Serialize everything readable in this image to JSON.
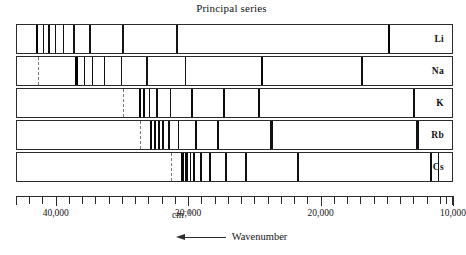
{
  "title": "Principal series",
  "axis": {
    "label": "Wavenumber",
    "unit_text": "cm",
    "unit_exponent": "−1",
    "unit_pos": 30500,
    "min": 10000,
    "max": 43000,
    "direction": "decreasing-right",
    "tick_labels": [
      {
        "value": 40000,
        "text": "40,000"
      },
      {
        "value": 30000,
        "text": "30,000"
      },
      {
        "value": 20000,
        "text": "20,000"
      },
      {
        "value": 10000,
        "text": "10,000"
      }
    ],
    "minor_tick_step": 1000,
    "minor_ticks": [
      43000,
      42000,
      41000,
      40000,
      39000,
      38000,
      37000,
      36000,
      35000,
      34000,
      33000,
      32000,
      31000,
      30000,
      29000,
      28000,
      27000,
      26000,
      25000,
      24000,
      23000,
      22000,
      21000,
      20000,
      19000,
      18000,
      17000,
      16000,
      15000,
      14000,
      13000,
      12000,
      11000,
      10500,
      10000
    ]
  },
  "chart_data": {
    "type": "spectrum",
    "title": "Principal series",
    "xlabel": "Wavenumber",
    "xunit": "cm^-1",
    "xlim": [
      43000,
      10000
    ],
    "x_axis_reversed": true,
    "ylabel": "",
    "grid": false,
    "legend": "row-labels-right",
    "series": [
      {
        "name": "Li",
        "label": "Li",
        "series_limit": 43487,
        "lines": [
          {
            "wavenumber": 43487,
            "intensity": 0.35,
            "style": "dashed"
          },
          {
            "wavenumber": 41500,
            "intensity": 1.0,
            "style": "solid"
          },
          {
            "wavenumber": 41000,
            "intensity": 0.6,
            "style": "solid"
          },
          {
            "wavenumber": 40600,
            "intensity": 0.6,
            "style": "solid"
          },
          {
            "wavenumber": 40100,
            "intensity": 0.6,
            "style": "solid"
          },
          {
            "wavenumber": 39500,
            "intensity": 0.55,
            "style": "solid"
          },
          {
            "wavenumber": 38700,
            "intensity": 0.5,
            "style": "solid"
          },
          {
            "wavenumber": 37500,
            "intensity": 0.5,
            "style": "solid"
          },
          {
            "wavenumber": 35000,
            "intensity": 0.5,
            "style": "solid"
          },
          {
            "wavenumber": 30900,
            "intensity": 0.5,
            "style": "solid"
          },
          {
            "wavenumber": 14904,
            "intensity": 1.0,
            "style": "solid"
          }
        ]
      },
      {
        "name": "Na",
        "label": "Na",
        "series_limit": 41449,
        "lines": [
          {
            "wavenumber": 41449,
            "intensity": 0.35,
            "style": "dashed"
          },
          {
            "wavenumber": 38500,
            "intensity": 1.0,
            "style": "solid"
          },
          {
            "wavenumber": 37900,
            "intensity": 0.6,
            "style": "solid"
          },
          {
            "wavenumber": 37300,
            "intensity": 0.6,
            "style": "solid"
          },
          {
            "wavenumber": 36400,
            "intensity": 0.55,
            "style": "solid"
          },
          {
            "wavenumber": 35100,
            "intensity": 0.5,
            "style": "solid"
          },
          {
            "wavenumber": 33200,
            "intensity": 0.5,
            "style": "solid"
          },
          {
            "wavenumber": 30270,
            "intensity": 0.5,
            "style": "solid"
          },
          {
            "wavenumber": 24500,
            "intensity": 0.8,
            "style": "solid"
          },
          {
            "wavenumber": 16968,
            "intensity": 0.6,
            "style": "solid"
          },
          {
            "wavenumber": 16956,
            "intensity": 0.6,
            "style": "solid"
          }
        ]
      },
      {
        "name": "K",
        "label": "K",
        "series_limit": 35009,
        "lines": [
          {
            "wavenumber": 35009,
            "intensity": 0.35,
            "style": "dashed"
          },
          {
            "wavenumber": 33700,
            "intensity": 0.9,
            "style": "solid"
          },
          {
            "wavenumber": 33400,
            "intensity": 0.9,
            "style": "solid"
          },
          {
            "wavenumber": 33000,
            "intensity": 0.6,
            "style": "solid"
          },
          {
            "wavenumber": 32400,
            "intensity": 0.6,
            "style": "solid"
          },
          {
            "wavenumber": 31400,
            "intensity": 0.55,
            "style": "solid"
          },
          {
            "wavenumber": 29800,
            "intensity": 0.7,
            "style": "solid"
          },
          {
            "wavenumber": 27400,
            "intensity": 0.7,
            "style": "solid"
          },
          {
            "wavenumber": 24700,
            "intensity": 0.7,
            "style": "solid"
          },
          {
            "wavenumber": 13042,
            "intensity": 0.6,
            "style": "solid"
          },
          {
            "wavenumber": 12985,
            "intensity": 0.6,
            "style": "solid"
          }
        ]
      },
      {
        "name": "Rb",
        "label": "Rb",
        "series_limit": 33691,
        "lines": [
          {
            "wavenumber": 33691,
            "intensity": 0.35,
            "style": "dashed"
          },
          {
            "wavenumber": 32900,
            "intensity": 0.8,
            "style": "solid"
          },
          {
            "wavenumber": 32600,
            "intensity": 0.8,
            "style": "solid"
          },
          {
            "wavenumber": 32300,
            "intensity": 0.7,
            "style": "solid"
          },
          {
            "wavenumber": 32000,
            "intensity": 0.7,
            "style": "solid"
          },
          {
            "wavenumber": 31500,
            "intensity": 0.6,
            "style": "solid"
          },
          {
            "wavenumber": 30800,
            "intensity": 0.6,
            "style": "solid"
          },
          {
            "wavenumber": 29500,
            "intensity": 0.7,
            "style": "solid"
          },
          {
            "wavenumber": 27800,
            "intensity": 0.7,
            "style": "solid"
          },
          {
            "wavenumber": 23800,
            "intensity": 0.55,
            "style": "solid"
          },
          {
            "wavenumber": 23700,
            "intensity": 0.55,
            "style": "solid"
          },
          {
            "wavenumber": 12817,
            "intensity": 0.55,
            "style": "solid"
          },
          {
            "wavenumber": 12737,
            "intensity": 0.55,
            "style": "solid"
          }
        ]
      },
      {
        "name": "Cs",
        "label": "Cs",
        "series_limit": 31406,
        "lines": [
          {
            "wavenumber": 31406,
            "intensity": 0.35,
            "style": "dashed"
          },
          {
            "wavenumber": 30500,
            "intensity": 0.8,
            "style": "solid"
          },
          {
            "wavenumber": 30200,
            "intensity": 0.8,
            "style": "solid"
          },
          {
            "wavenumber": 29900,
            "intensity": 0.7,
            "style": "solid"
          },
          {
            "wavenumber": 29600,
            "intensity": 0.7,
            "style": "solid"
          },
          {
            "wavenumber": 29100,
            "intensity": 0.6,
            "style": "solid"
          },
          {
            "wavenumber": 28400,
            "intensity": 0.7,
            "style": "solid"
          },
          {
            "wavenumber": 27200,
            "intensity": 0.6,
            "style": "solid"
          },
          {
            "wavenumber": 25700,
            "intensity": 0.6,
            "style": "solid"
          },
          {
            "wavenumber": 21800,
            "intensity": 0.6,
            "style": "solid"
          },
          {
            "wavenumber": 11735,
            "intensity": 0.6,
            "style": "solid"
          },
          {
            "wavenumber": 11178,
            "intensity": 0.6,
            "style": "solid"
          }
        ]
      }
    ]
  }
}
